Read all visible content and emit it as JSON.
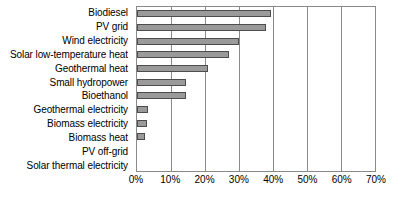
{
  "chart_data": {
    "type": "bar",
    "orientation": "horizontal",
    "title": "",
    "subtitle": "",
    "xlabel": "",
    "ylabel": "",
    "xlim": [
      0,
      70
    ],
    "xunit": "%",
    "grid": true,
    "legend": null,
    "legend_position": "none",
    "xticks": [
      "0%",
      "10%",
      "20%",
      "30%",
      "40%",
      "50%",
      "60%",
      "70%"
    ],
    "xtick_values": [
      0,
      10,
      20,
      30,
      40,
      50,
      60,
      70
    ],
    "categories": [
      "Biodiesel",
      "PV grid",
      "Wind electricity",
      "Solar low-temperature heat",
      "Geothermal heat",
      "Small hydropower",
      "Bioethanol",
      "Geothermal electricity",
      "Biomass electricity",
      "Biomass heat",
      "PV off-grid",
      "Solar thermal electricity"
    ],
    "values": [
      39.5,
      38.0,
      30.0,
      27.0,
      21.0,
      14.3,
      14.3,
      3.2,
      3.0,
      2.3,
      0,
      0
    ],
    "series": [
      {
        "name": "",
        "values": [
          39.5,
          38.0,
          30.0,
          27.0,
          21.0,
          14.3,
          14.3,
          3.2,
          3.0,
          2.3,
          0,
          0
        ]
      }
    ]
  },
  "style": {
    "bar_fill": "#9a9a9a",
    "bar_border": "#4d4d4d",
    "grid_color": "#8a8a8a",
    "axis_color": "#8a8a8a",
    "background": "#ffffff",
    "text_color": "#000000"
  }
}
